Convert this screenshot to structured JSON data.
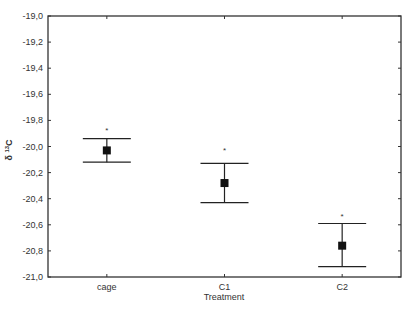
{
  "chart_data": {
    "type": "scatter",
    "subtype": "mean-with-error-bars",
    "title": "",
    "xlabel": "Treatment",
    "ylabel": "δ 13C",
    "ylabel_parts": {
      "delta": "δ",
      "sup": "13",
      "element": "C"
    },
    "ylim": [
      -21.0,
      -19.0
    ],
    "yticks": [
      -19.0,
      -19.2,
      -19.4,
      -19.6,
      -19.8,
      -20.0,
      -20.2,
      -20.4,
      -20.6,
      -20.8,
      -21.0
    ],
    "ytick_labels": [
      "-19,0",
      "-19,2",
      "-19,4",
      "-19,6",
      "-19,8",
      "-20,0",
      "-20,2",
      "-20,4",
      "-20,6",
      "-20,8",
      "-21,0"
    ],
    "categories": [
      "cage",
      "C1",
      "C2"
    ],
    "series": [
      {
        "name": "mean",
        "values": [
          -20.03,
          -20.28,
          -20.76
        ],
        "upper": [
          -19.94,
          -20.13,
          -20.59
        ],
        "lower": [
          -20.12,
          -20.43,
          -20.92
        ],
        "annotation": [
          "*",
          "*",
          "*"
        ],
        "annotation_y": [
          -19.87,
          -20.03,
          -20.53
        ]
      }
    ],
    "grid": false,
    "legend": null
  }
}
